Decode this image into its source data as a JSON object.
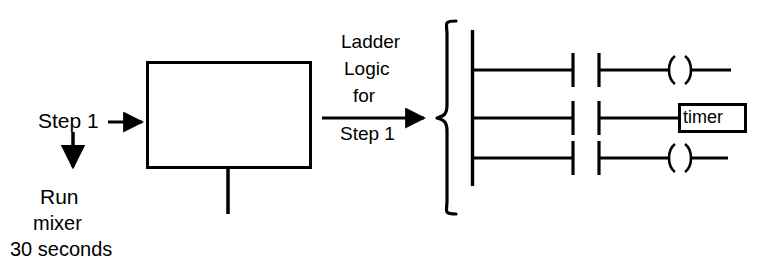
{
  "diagram": {
    "title": "Ladder Logic for Step 1",
    "type": "sequential-function-chart-to-ladder-logic",
    "colors": {
      "background": "#ffffff",
      "stroke": "#000000",
      "text": "#000000"
    },
    "step_block": {
      "name": "step-block",
      "input_label": "Step 1",
      "action_lines": [
        "Run",
        "mixer",
        "30 seconds"
      ],
      "action_text": "Run mixer 30 seconds"
    },
    "transition": {
      "name": "transition-arrow",
      "lines_above": [
        "Ladder",
        "Logic",
        "for"
      ],
      "line_below": "Step 1",
      "full_text": "Ladder Logic for Step 1"
    },
    "ladder": {
      "name": "ladder-logic-diagram",
      "rail_label": "left-power-rail",
      "rungs": [
        {
          "index": 1,
          "contacts": [
            "normally-open-contact",
            "normally-open-contact"
          ],
          "output_type": "coil",
          "output_label": ""
        },
        {
          "index": 2,
          "contacts": [
            "normally-open-contact",
            "normally-open-contact"
          ],
          "output_type": "box",
          "output_label": "timer"
        },
        {
          "index": 3,
          "contacts": [
            "normally-open-contact",
            "normally-open-contact"
          ],
          "output_type": "coil",
          "output_label": ""
        }
      ]
    }
  }
}
